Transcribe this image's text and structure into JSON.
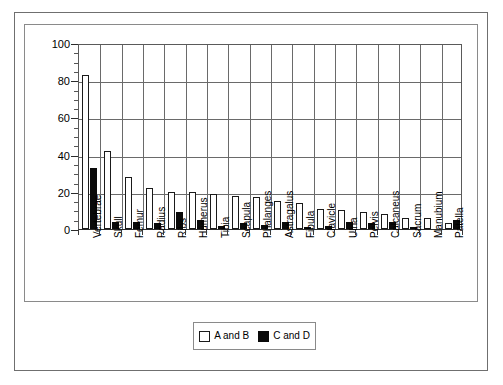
{
  "chart_data": {
    "type": "bar",
    "title": "",
    "xlabel": "",
    "ylabel": "",
    "ylim": [
      0,
      100
    ],
    "ytick_values": [
      0,
      20,
      40,
      60,
      80,
      100
    ],
    "ytick_labels": [
      "0",
      "20",
      "40",
      "60",
      "80",
      "100"
    ],
    "minor_tick_step": 5,
    "grid": "horizontal-and-vertical",
    "legend_position": "bottom-center",
    "categories": [
      "Vertebrae",
      "Skull",
      "Femur",
      "Radius",
      "Ribs",
      "Humerus",
      "Tibia",
      "Scapula",
      "Phalanges",
      "Astragalus",
      "Fibula",
      "Clavicle",
      "Ulna",
      "Pelvis",
      "Calcaneus",
      "Sacrum",
      "Manubium",
      "Patella"
    ],
    "series": [
      {
        "name": "A and B",
        "color": "#ffffff",
        "edge_color": "#1a1a1a",
        "values": [
          83,
          42,
          28,
          22,
          20,
          20,
          19,
          18,
          17,
          15,
          14,
          11,
          10,
          9,
          8,
          6,
          6,
          3
        ]
      },
      {
        "name": "C and D",
        "color": "#0a0a0a",
        "edge_color": "#0a0a0a",
        "values": [
          33,
          4,
          4,
          3,
          9,
          5,
          1.5,
          3,
          2,
          4,
          1,
          1.5,
          4,
          3,
          4,
          1,
          0,
          5
        ]
      }
    ]
  },
  "legend": {
    "entries": [
      {
        "label": "A and B",
        "swatch": "white-square-icon"
      },
      {
        "label": "C and D",
        "swatch": "black-square-icon"
      }
    ]
  }
}
